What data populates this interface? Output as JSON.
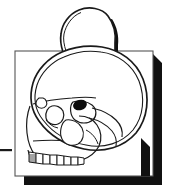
{
  "figure": {
    "title": "Lateral skull illustration with cranial dome overlay",
    "kind": "line-art-illustration",
    "background_color": "#ffffff",
    "line_color": "#1a1a1a",
    "shadow_color": "#111111",
    "fill_color": "#ffffff",
    "canvas": {
      "width": 173,
      "height": 193
    }
  },
  "card": {
    "name": "background-card",
    "x": 15,
    "y": 51,
    "width": 138,
    "height": 125,
    "border_color": "#555555",
    "fill_color": "#ffffff",
    "shadow_offset": 9,
    "shadow_color": "#111111"
  },
  "marker": {
    "name": "left-scale-tick",
    "x": 0,
    "y": 149,
    "width": 12,
    "height": 2,
    "color": "#1a1a1a"
  },
  "parts": [
    {
      "id": "dome",
      "label": "Cranial dome overlay",
      "interactable": false
    },
    {
      "id": "cranium-outer",
      "label": "Cranial vault outer contour",
      "interactable": false
    },
    {
      "id": "cranium-inner",
      "label": "Cranial vault inner contour",
      "interactable": false
    },
    {
      "id": "frontal",
      "label": "Frontal bone",
      "interactable": false
    },
    {
      "id": "orbit",
      "label": "Orbital socket",
      "interactable": false
    },
    {
      "id": "orbital-foramen",
      "label": "Optic foramen (filled)",
      "interactable": false
    },
    {
      "id": "nasal",
      "label": "Nasal bone and aperture",
      "interactable": false
    },
    {
      "id": "zygomatic",
      "label": "Zygomatic arch",
      "interactable": false
    },
    {
      "id": "maxilla",
      "label": "Maxilla",
      "interactable": false
    },
    {
      "id": "teeth",
      "label": "Maxillary dentition",
      "interactable": false
    },
    {
      "id": "temporal",
      "label": "Temporal region",
      "interactable": false
    },
    {
      "id": "occipital",
      "label": "Occipital contour",
      "interactable": false
    }
  ],
  "teeth": {
    "count": 8,
    "row_y": 160,
    "start_x": 29,
    "end_x": 84
  }
}
